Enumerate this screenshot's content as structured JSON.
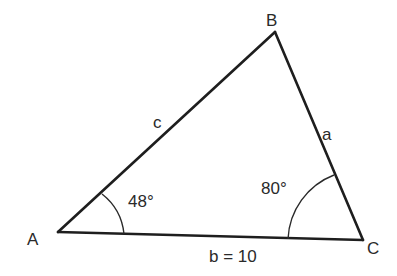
{
  "diagram": {
    "type": "triangle",
    "stroke_color": "#1e1e1e",
    "vertices": {
      "A": {
        "label": "A",
        "x": 58,
        "y": 232
      },
      "B": {
        "label": "B",
        "x": 275,
        "y": 32
      },
      "C": {
        "label": "C",
        "x": 363,
        "y": 240
      }
    },
    "sides": {
      "a": {
        "label": "a"
      },
      "b": {
        "label": "b = 10"
      },
      "c": {
        "label": "c"
      }
    },
    "angles": {
      "A": {
        "label": "48°"
      },
      "C": {
        "label": "80°"
      }
    }
  }
}
